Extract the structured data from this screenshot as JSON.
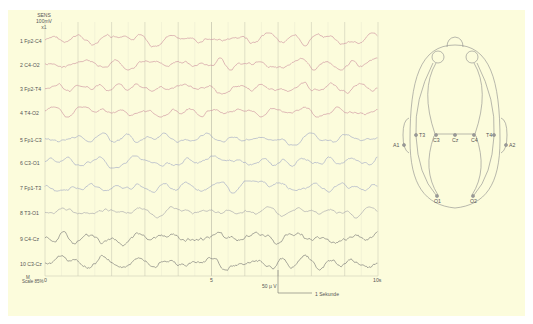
{
  "header": {
    "sens_title": "SENS",
    "sens_value": "100mV",
    "sens_mult": "x1"
  },
  "channels": [
    {
      "index": 1,
      "label": "1 Fp2-C4",
      "color": "#c98a9a"
    },
    {
      "index": 2,
      "label": "2 C4-O2",
      "color": "#c98a9a"
    },
    {
      "index": 3,
      "label": "3 Fp2-T4",
      "color": "#c98a9a"
    },
    {
      "index": 4,
      "label": "4  T4-O2",
      "color": "#c98a9a"
    },
    {
      "index": 5,
      "label": "5 Fp1-C3",
      "color": "#9aa3c4"
    },
    {
      "index": 6,
      "label": "6  C3-O1",
      "color": "#9aa3c4"
    },
    {
      "index": 7,
      "label": "7 Fp1-T3",
      "color": "#9aa3c4"
    },
    {
      "index": 8,
      "label": "8  T3-O1",
      "color": "#a0a0a8"
    },
    {
      "index": 9,
      "label": "9  C4-Cz",
      "color": "#6e6e6e"
    },
    {
      "index": 10,
      "label": "10 C3-Cz",
      "color": "#6e6e6e"
    }
  ],
  "scale_note": {
    "line1": "M",
    "line2": "Scale 85%"
  },
  "time_axis": {
    "ticks": [
      "0",
      "5",
      "10s"
    ]
  },
  "calibration": {
    "amplitude": "50 µ V",
    "time": "1 Sekunde"
  },
  "head_diagram": {
    "electrodes": [
      "T3",
      "C3",
      "Cz",
      "C4",
      "T4",
      "A1",
      "A2",
      "O1",
      "O2"
    ]
  },
  "colors": {
    "panel_bg": "#fcfcdc",
    "grid": "#b8b8a8",
    "text": "#555555"
  }
}
